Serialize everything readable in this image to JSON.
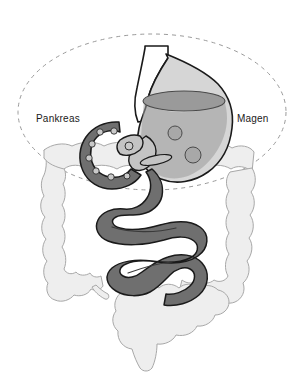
{
  "figure": {
    "width": 305,
    "height": 380,
    "background_color": "#ffffff"
  },
  "labels": [
    {
      "id": "pankreas",
      "text": "Pankreas",
      "color": "#1a1a1a",
      "x": 36,
      "y": 113
    },
    {
      "id": "magen",
      "text": "Magen",
      "color": "#1a1a1a",
      "x": 237,
      "y": 113
    }
  ],
  "colors": {
    "outline": "#1a1a1a",
    "stomach_body": "#d6d6d6",
    "stomach_fluid": "#9a9a9a",
    "stomach_fluid_surface": "#8e8e8e",
    "stomach_particle": "#a8a8a8",
    "duodenum": "#6f6f6f",
    "duodenum_islet": "#c9c9c9",
    "small_intestine": "#6f6f6f",
    "pancreas_gland": "#c4c4c4",
    "colon": "#eeeeee",
    "colon_outline": "#9a9a9a",
    "esophagus": "#ffffff",
    "boundary_dash": "#9a9a9a"
  },
  "structures": [
    {
      "name": "boundary-ellipse",
      "label": "Abdominal boundary",
      "style": "dashed",
      "interactable": false
    },
    {
      "name": "colon",
      "label": "Dickdarm (Kolon)",
      "fill": "#eeeeee",
      "interactable": false
    },
    {
      "name": "esophagus",
      "label": "Speiseröhre",
      "fill": "#ffffff",
      "interactable": false
    },
    {
      "name": "stomach",
      "label": "Magen",
      "fill": "#d6d6d6",
      "interactable": false
    },
    {
      "name": "stomach-fluid",
      "label": "Mageninhalt",
      "fill": "#9a9a9a",
      "interactable": false
    },
    {
      "name": "pancreas",
      "label": "Pankreas",
      "fill": "#c4c4c4",
      "interactable": false
    },
    {
      "name": "duodenum",
      "label": "Duodenum",
      "fill": "#6f6f6f",
      "interactable": false
    },
    {
      "name": "small-intestine",
      "label": "Dünndarm",
      "fill": "#6f6f6f",
      "interactable": false
    }
  ],
  "stomach_particles": [
    {
      "cx": 175,
      "cy": 133,
      "r": 7
    },
    {
      "cx": 193,
      "cy": 155,
      "r": 8
    }
  ],
  "duodenum_islets": [
    {
      "cx": 100,
      "cy": 132,
      "r": 3.2
    },
    {
      "cx": 114,
      "cy": 131,
      "r": 3.2
    },
    {
      "cx": 92,
      "cy": 144,
      "r": 3.2
    },
    {
      "cx": 90,
      "cy": 158,
      "r": 3.2
    },
    {
      "cx": 97,
      "cy": 170,
      "r": 3.2
    },
    {
      "cx": 112,
      "cy": 175,
      "r": 3.2
    },
    {
      "cx": 128,
      "cy": 176,
      "r": 3.2
    },
    {
      "cx": 115,
      "cy": 158,
      "r": 3.0
    }
  ]
}
